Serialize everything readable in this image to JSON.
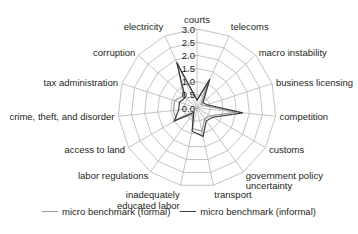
{
  "chart_data": {
    "type": "radar",
    "title": "",
    "categories": [
      "courts",
      "telecoms",
      "macro instability",
      "business licensing",
      "competition",
      "customs",
      "government policy uncertainty",
      "transport",
      "inadequately educated labor",
      "labor regulations",
      "access to land",
      "crime, theft, and disorder",
      "tax administration",
      "corruption",
      "electricity"
    ],
    "category_label_lines": [
      [
        "courts"
      ],
      [
        "telecoms"
      ],
      [
        "macro instability"
      ],
      [
        "business licensing"
      ],
      [
        "competition"
      ],
      [
        "customs"
      ],
      [
        "government policy",
        "uncertainty"
      ],
      [
        "transport"
      ],
      [
        "inadequately",
        "educated labor"
      ],
      [
        "labor regulations"
      ],
      [
        "access to land"
      ],
      [
        "crime, theft, and disorder"
      ],
      [
        "tax administration"
      ],
      [
        "corruption"
      ],
      [
        "electricity"
      ]
    ],
    "series": [
      {
        "name": "micro benchmark (formal)",
        "color": "#9a9a9a",
        "values": [
          0.3,
          1.0,
          0.2,
          0.3,
          1.5,
          0.6,
          0.5,
          0.9,
          0.8,
          0.3,
          0.9,
          0.9,
          0.9,
          0.7,
          1.8
        ]
      },
      {
        "name": "micro benchmark (informal)",
        "color": "#3a3a3a",
        "values": [
          0.3,
          1.2,
          0.3,
          0.4,
          1.75,
          0.7,
          0.6,
          1.1,
          0.9,
          0.2,
          1.0,
          0.7,
          0.7,
          0.6,
          1.9
        ]
      }
    ],
    "radial_ticks": [
      "0.0",
      "0.5",
      "1.0",
      "1.5",
      "2.0",
      "2.5",
      "3.0"
    ],
    "rlim": [
      0,
      3.0
    ],
    "grid": true,
    "legend_position": "bottom"
  },
  "legend": {
    "formal_label": "micro benchmark (formal)",
    "informal_label": "micro benchmark (informal)",
    "formal_color": "#9a9a9a",
    "informal_color": "#3a3a3a"
  }
}
